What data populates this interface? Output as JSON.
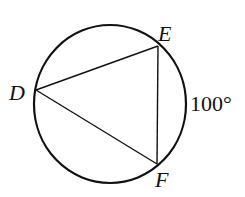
{
  "diagram": {
    "type": "inscribed-triangle-in-circle",
    "points": {
      "D": {
        "label": "D"
      },
      "E": {
        "label": "E"
      },
      "F": {
        "label": "F"
      }
    },
    "arc_label": "100°",
    "arc": "EF",
    "stroke_color": "#111111"
  }
}
